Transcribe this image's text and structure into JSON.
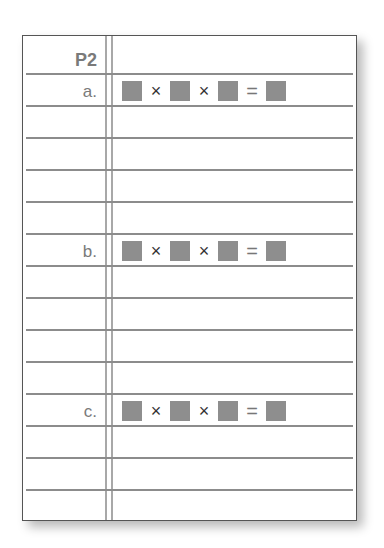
{
  "worksheet": {
    "header_label": "P2",
    "problems": [
      {
        "label": "a.",
        "expression": {
          "blanks": 4,
          "operators": [
            "×",
            "×",
            "="
          ]
        }
      },
      {
        "label": "b.",
        "expression": {
          "blanks": 4,
          "operators": [
            "×",
            "×",
            "="
          ]
        }
      },
      {
        "label": "c.",
        "expression": {
          "blanks": 4,
          "operators": [
            "×",
            "×",
            "="
          ]
        }
      }
    ],
    "colors": {
      "blank_box": "#8e8e8e",
      "rule_line": "#8c8c8c",
      "margin_line": "#a8a8a8",
      "label_text": "#7a7a7a",
      "border": "#555555"
    }
  }
}
